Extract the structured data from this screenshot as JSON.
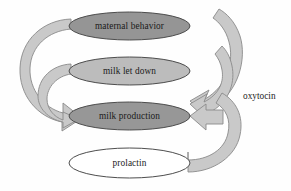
{
  "diagram": {
    "background_color": "#fefefe",
    "nodes": [
      {
        "id": "maternal-behavior",
        "label": "maternal behavior",
        "fill": "#959595",
        "stroke": "#4d4d4d",
        "cx": 129.5,
        "cy": 26,
        "rx": 60.5,
        "ry": 14
      },
      {
        "id": "milk-let-down",
        "label": "milk let down",
        "fill": "#bcbcbc",
        "stroke": "#4d4d4d",
        "cx": 129.5,
        "cy": 71,
        "rx": 60.5,
        "ry": 14
      },
      {
        "id": "milk-production",
        "label": "milk production",
        "fill": "#979797",
        "stroke": "#4d4d4d",
        "cx": 129.5,
        "cy": 116,
        "rx": 60.5,
        "ry": 14
      },
      {
        "id": "prolactin",
        "label": "prolactin",
        "fill": "#ffffff",
        "stroke": "#676767",
        "cx": 129.5,
        "cy": 163,
        "rx": 60.5,
        "ry": 15
      }
    ],
    "edges": [
      {
        "id": "oxytocin-to-maternal-behavior",
        "label": "",
        "from": "oxytocin-source",
        "to": "maternal-behavior",
        "band_fill": "#c9c9c9",
        "band_stroke": "#8a8a8a"
      },
      {
        "id": "oxytocin-to-milk-let-down",
        "label": "",
        "from": "oxytocin-source",
        "to": "milk-let-down",
        "band_fill": "#c9c9c9",
        "band_stroke": "#8a8a8a"
      },
      {
        "id": "prolactin-to-milk-production",
        "label": "",
        "from": "prolactin",
        "to": "milk-production",
        "band_fill": "#c9c9c9",
        "band_stroke": "#8a8a8a"
      },
      {
        "id": "maternal-behavior-to-milk-production",
        "label": "",
        "from": "maternal-behavior",
        "to": "milk-production",
        "band_fill": "#c9c9c9",
        "band_stroke": "#8a8a8a"
      },
      {
        "id": "milk-let-down-to-milk-production",
        "label": "",
        "from": "milk-let-down",
        "to": "milk-production",
        "band_fill": "#c9c9c9",
        "band_stroke": "#8a8a8a"
      }
    ],
    "annotations": [
      {
        "id": "oxytocin-label",
        "label": "oxytocin",
        "x": 243,
        "y": 97
      }
    ]
  }
}
